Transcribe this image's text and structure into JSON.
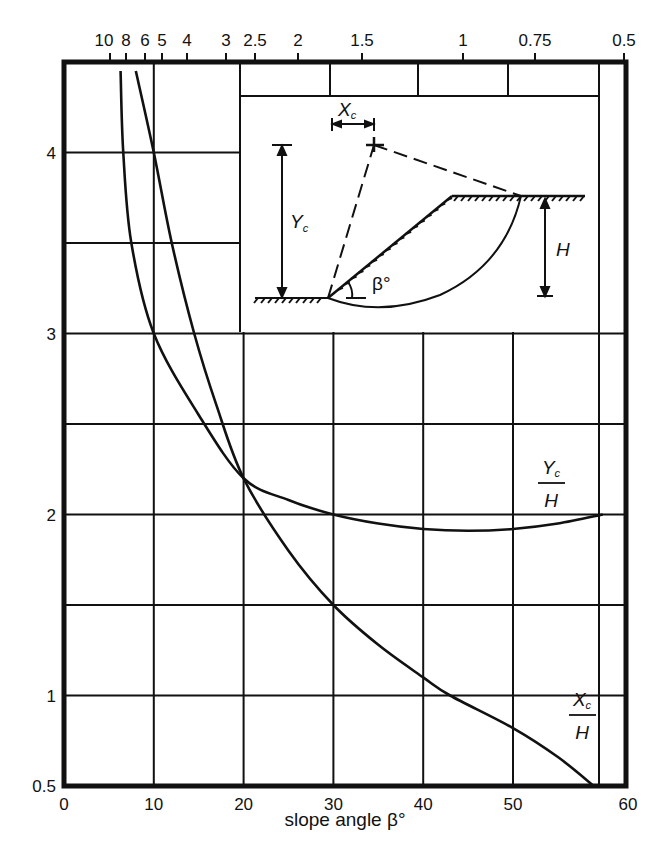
{
  "chart_data": {
    "type": "line",
    "title": "",
    "xlabel": "slope angle β°",
    "ylabel": "",
    "xlim": [
      0,
      60
    ],
    "ylim": [
      0.5,
      4.5
    ],
    "grid": true,
    "x_ticks": [
      "0",
      "10",
      "20",
      "30",
      "40",
      "50",
      "60"
    ],
    "y_ticks": [
      "0.5",
      "1",
      "2",
      "3",
      "4"
    ],
    "top_axis_ticks": [
      "10",
      "8",
      "6",
      "5",
      "4",
      "3",
      "2.5",
      "2",
      "1.5",
      "1",
      "0.75",
      "0.5"
    ],
    "series": [
      {
        "name": "Yc/H",
        "label_num": "Y",
        "label_sub": "c",
        "label_den": "H",
        "x": [
          6.3,
          6.6,
          7.5,
          10,
          15,
          20,
          25,
          30,
          35,
          40,
          45,
          50,
          55,
          60
        ],
        "y": [
          4.45,
          4.0,
          3.5,
          3.0,
          2.55,
          2.2,
          2.08,
          2.0,
          1.95,
          1.92,
          1.91,
          1.92,
          1.95,
          2.0
        ]
      },
      {
        "name": "Xc/H",
        "label_num": "X",
        "label_sub": "c",
        "label_den": "H",
        "x": [
          8.0,
          10,
          12,
          14.5,
          17,
          20,
          25,
          30,
          35,
          40,
          43,
          50,
          55,
          59
        ],
        "y": [
          4.45,
          4.0,
          3.5,
          3.0,
          2.6,
          2.2,
          1.8,
          1.5,
          1.28,
          1.1,
          1.0,
          0.82,
          0.66,
          0.5
        ]
      }
    ],
    "inset": {
      "labels": {
        "xc": "X",
        "xc_sub": "c",
        "yc": "Y",
        "yc_sub": "c",
        "h": "H",
        "beta": "β°"
      }
    }
  }
}
